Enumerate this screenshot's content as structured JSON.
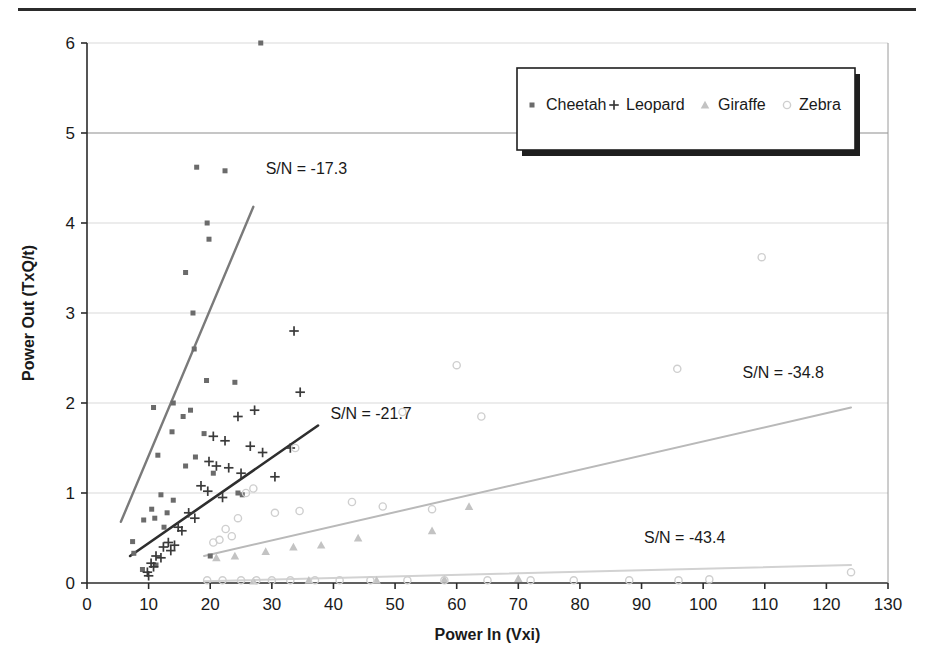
{
  "chart_data": {
    "type": "scatter",
    "title": "",
    "xlabel": "Power In (Vxi)",
    "ylabel": "Power Out (TxQ/t)",
    "xlim": [
      0,
      130
    ],
    "ylim": [
      0,
      6
    ],
    "xticks": [
      0,
      10,
      20,
      30,
      40,
      50,
      60,
      70,
      80,
      90,
      100,
      110,
      120,
      130
    ],
    "yticks": [
      0,
      1,
      2,
      3,
      4,
      5,
      6
    ],
    "grid": "horizontal",
    "legend_position": "top-right",
    "colors": {
      "cheetah": "#6b6b6b",
      "leopard": "#3a3a3a",
      "giraffe": "#c3c3c3",
      "zebra": "#cfcfcf",
      "cheetah_fit": "#7a7a7a",
      "leopard_fit": "#2e2e2e",
      "giraffe_fit": "#b9b9b9",
      "zebra_fit": "#d2d2d2",
      "axis": "#2b2b2b",
      "grid": "#d9d9d9"
    },
    "series": [
      {
        "name": "Cheetah",
        "marker": "square",
        "color": "#6b6b6b",
        "points": [
          [
            28.2,
            6.0
          ],
          [
            17.8,
            4.62
          ],
          [
            22.4,
            4.58
          ],
          [
            19.5,
            4.0
          ],
          [
            19.8,
            3.82
          ],
          [
            16.0,
            3.45
          ],
          [
            17.2,
            3.0
          ],
          [
            17.4,
            2.6
          ],
          [
            19.4,
            2.25
          ],
          [
            24.0,
            2.23
          ],
          [
            14.0,
            2.0
          ],
          [
            10.8,
            1.95
          ],
          [
            16.8,
            1.92
          ],
          [
            15.6,
            1.85
          ],
          [
            13.8,
            1.68
          ],
          [
            19.0,
            1.66
          ],
          [
            11.5,
            1.42
          ],
          [
            17.6,
            1.4
          ],
          [
            16.0,
            1.3
          ],
          [
            20.5,
            1.22
          ],
          [
            24.5,
            1.0
          ],
          [
            25.2,
            0.98
          ],
          [
            12.0,
            0.98
          ],
          [
            14.0,
            0.92
          ],
          [
            10.5,
            0.82
          ],
          [
            13.0,
            0.78
          ],
          [
            11.0,
            0.72
          ],
          [
            9.2,
            0.7
          ],
          [
            12.5,
            0.62
          ],
          [
            7.4,
            0.46
          ],
          [
            7.6,
            0.33
          ],
          [
            20.0,
            0.3
          ],
          [
            11.2,
            0.2
          ],
          [
            9.0,
            0.15
          ]
        ]
      },
      {
        "name": "Leopard",
        "marker": "plus",
        "color": "#3a3a3a",
        "points": [
          [
            33.6,
            2.8
          ],
          [
            34.6,
            2.12
          ],
          [
            27.2,
            1.92
          ],
          [
            24.5,
            1.85
          ],
          [
            20.5,
            1.63
          ],
          [
            22.4,
            1.58
          ],
          [
            26.5,
            1.52
          ],
          [
            33.0,
            1.5
          ],
          [
            28.5,
            1.45
          ],
          [
            19.8,
            1.35
          ],
          [
            21.0,
            1.3
          ],
          [
            23.0,
            1.28
          ],
          [
            25.0,
            1.22
          ],
          [
            30.5,
            1.18
          ],
          [
            18.5,
            1.08
          ],
          [
            19.6,
            1.02
          ],
          [
            22.0,
            0.95
          ],
          [
            16.5,
            0.78
          ],
          [
            17.5,
            0.72
          ],
          [
            14.8,
            0.62
          ],
          [
            15.4,
            0.58
          ],
          [
            13.2,
            0.45
          ],
          [
            14.2,
            0.42
          ],
          [
            12.4,
            0.4
          ],
          [
            13.6,
            0.36
          ],
          [
            11.2,
            0.3
          ],
          [
            12.0,
            0.28
          ],
          [
            10.4,
            0.22
          ],
          [
            10.8,
            0.18
          ],
          [
            9.8,
            0.12
          ],
          [
            10.0,
            0.08
          ]
        ]
      },
      {
        "name": "Giraffe",
        "marker": "triangle",
        "color": "#c3c3c3",
        "points": [
          [
            62.0,
            0.85
          ],
          [
            56.0,
            0.58
          ],
          [
            44.0,
            0.5
          ],
          [
            38.0,
            0.42
          ],
          [
            33.5,
            0.4
          ],
          [
            29.0,
            0.35
          ],
          [
            24.0,
            0.3
          ],
          [
            21.0,
            0.28
          ],
          [
            70.0,
            0.05
          ],
          [
            58.0,
            0.04
          ],
          [
            47.0,
            0.03
          ],
          [
            36.0,
            0.03
          ],
          [
            27.0,
            0.02
          ]
        ]
      },
      {
        "name": "Zebra",
        "marker": "circle",
        "color": "#cfcfcf",
        "points": [
          [
            109.5,
            3.62
          ],
          [
            95.8,
            2.38
          ],
          [
            60.0,
            2.42
          ],
          [
            64.0,
            1.85
          ],
          [
            51.2,
            1.9
          ],
          [
            33.8,
            1.5
          ],
          [
            27.0,
            1.05
          ],
          [
            25.8,
            1.0
          ],
          [
            43.0,
            0.9
          ],
          [
            48.0,
            0.85
          ],
          [
            56.0,
            0.82
          ],
          [
            34.5,
            0.8
          ],
          [
            30.5,
            0.78
          ],
          [
            24.5,
            0.72
          ],
          [
            22.5,
            0.6
          ],
          [
            23.5,
            0.52
          ],
          [
            21.5,
            0.48
          ],
          [
            20.5,
            0.45
          ],
          [
            124.0,
            0.12
          ],
          [
            101.0,
            0.04
          ],
          [
            96.0,
            0.03
          ],
          [
            88.0,
            0.03
          ],
          [
            79.0,
            0.03
          ],
          [
            72.0,
            0.03
          ],
          [
            65.0,
            0.03
          ],
          [
            58.0,
            0.03
          ],
          [
            52.0,
            0.03
          ],
          [
            46.0,
            0.03
          ],
          [
            41.0,
            0.03
          ],
          [
            37.0,
            0.03
          ],
          [
            33.0,
            0.03
          ],
          [
            30.0,
            0.03
          ],
          [
            27.5,
            0.03
          ],
          [
            25.0,
            0.03
          ],
          [
            22.0,
            0.03
          ],
          [
            19.5,
            0.03
          ]
        ]
      }
    ],
    "trend_lines": [
      {
        "name": "Cheetah trend",
        "label": "S/N = -17.3",
        "color": "#7a7a7a",
        "width": 2.4,
        "x0": 5.5,
        "y0": 0.68,
        "x1": 27.0,
        "y1": 4.18,
        "label_x": 29.0,
        "label_y": 4.55
      },
      {
        "name": "Leopard trend",
        "label": "S/N = -21.7",
        "color": "#2e2e2e",
        "width": 2.6,
        "x0": 7.0,
        "y0": 0.3,
        "x1": 37.5,
        "y1": 1.75,
        "label_x": 39.5,
        "label_y": 1.82
      },
      {
        "name": "Giraffe trend",
        "label": "S/N = -34.8",
        "color": "#b9b9b9",
        "width": 2.0,
        "x0": 19.0,
        "y0": 0.3,
        "x1": 124.0,
        "y1": 1.95,
        "label_x": 113.0,
        "label_y": 2.28
      },
      {
        "name": "Zebra trend",
        "label": "S/N = -43.4",
        "color": "#d2d2d2",
        "width": 2.0,
        "x0": 19.0,
        "y0": 0.02,
        "x1": 124.0,
        "y1": 0.2,
        "label_x": 97.0,
        "label_y": 0.45
      }
    ]
  },
  "legend": {
    "items": [
      {
        "label": "Cheetah",
        "marker": "square",
        "color": "#6b6b6b"
      },
      {
        "label": "Leopard",
        "marker": "plus",
        "color": "#3a3a3a"
      },
      {
        "label": "Giraffe",
        "marker": "triangle",
        "color": "#c3c3c3"
      },
      {
        "label": "Zebra",
        "marker": "circle",
        "color": "#cfcfcf"
      }
    ]
  }
}
